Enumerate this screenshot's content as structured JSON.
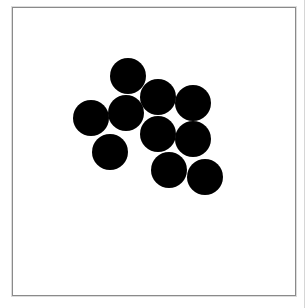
{
  "figure": {
    "background": "#ffffff",
    "frame": {
      "x": 12,
      "y": 7,
      "width": 284,
      "height": 289,
      "stroke": "#8a8a8a"
    },
    "dot_color": "#000000",
    "dot_count": 10,
    "dots": [
      {
        "cx": 128,
        "cy": 76,
        "r": 18
      },
      {
        "cx": 158,
        "cy": 97,
        "r": 18
      },
      {
        "cx": 193,
        "cy": 103,
        "r": 18
      },
      {
        "cx": 91,
        "cy": 118,
        "r": 18
      },
      {
        "cx": 126,
        "cy": 113,
        "r": 18
      },
      {
        "cx": 158,
        "cy": 134,
        "r": 18
      },
      {
        "cx": 193,
        "cy": 139,
        "r": 18
      },
      {
        "cx": 110,
        "cy": 152,
        "r": 18
      },
      {
        "cx": 169,
        "cy": 170,
        "r": 18
      },
      {
        "cx": 205,
        "cy": 177,
        "r": 18
      }
    ]
  }
}
